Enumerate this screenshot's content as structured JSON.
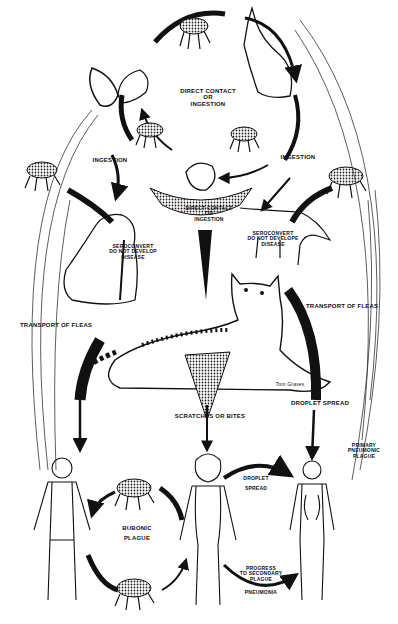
{
  "colors": {
    "ink": "#111111",
    "paper": "#ffffff",
    "shade": "#555555"
  },
  "figures": {
    "top_cycle": [
      "flea",
      "ground-squirrel",
      "rabbit",
      "flea",
      "flea",
      "rodent"
    ],
    "middle": [
      "dog",
      "coyote",
      "cat",
      "flea",
      "flea"
    ],
    "bottom": [
      "human-man",
      "human-woman",
      "human-child",
      "flea",
      "flea"
    ]
  },
  "labels": {
    "direct_contact_top": "DIRECT CONTACT\nOR\nINGESTION",
    "ingestion_left": "INGESTION",
    "ingestion_right": "INGESTION",
    "direct_contact_mid": "DIRECT CONTACT\nOR\nINGESTION",
    "dog_note": "SEROCONVERT\nDO NOT DEVELOP\nDISEASE",
    "coyote_note": "SEROCONVERT\nDO NOT DEVELOPE\nDISEASE",
    "transport_left": "TRANSPORT OF FLEAS",
    "transport_right": "TRANSPORT OF FLEAS",
    "scratches": "SCRATCHES OR BITES",
    "droplet_spread_top": "DROPLET SPREAD",
    "primary_pneumonic": "PRIMARY\nPNEUMONIC\nPLAGUE",
    "bubonic": "BUBONIC\nPLAGUE",
    "droplet_spread_bottom": "DROPLET\nSPREAD",
    "secondary": "PROGRESS\nTO SECONDARY\nPLAGUE",
    "pneumonia": "PNEUMONIA",
    "signature": "Tom Graves"
  }
}
